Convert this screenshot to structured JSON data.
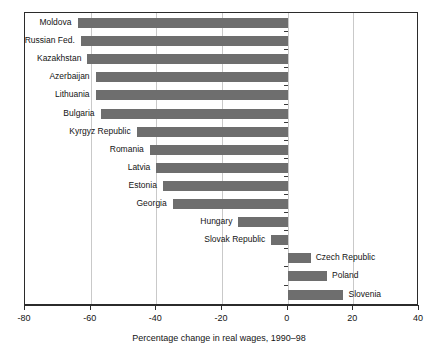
{
  "chart_data": {
    "type": "bar",
    "orientation": "horizontal",
    "title": "",
    "subtitle": "",
    "xlabel": "Percentage change in real wages, 1990–98",
    "ylabel": "",
    "xlim": [
      -80,
      40
    ],
    "ylim": null,
    "grid": "vertical gridlines at each major x tick",
    "legend": "none",
    "bar_color": "#6e6e6e",
    "frame_color": "#2b2b2b",
    "gridline_color": "#c9c9c9",
    "xticks": [
      -80,
      -60,
      -40,
      -20,
      0,
      20,
      40
    ],
    "xticklabels": [
      "-80",
      "-60",
      "-40",
      "-20",
      "0",
      "20",
      "40"
    ],
    "categories": [
      "Moldova",
      "Russian Fed.",
      "Kazakhstan",
      "Azerbaijan",
      "Lithuania",
      "Bulgaria",
      "Kyrgyz Republic",
      "Romania",
      "Latvia",
      "Estonia",
      "Georgia",
      "Hungary",
      "Slovak Republic",
      "Czech Republic",
      "Poland",
      "Slovenia"
    ],
    "values": [
      -64,
      -63,
      -61,
      -58.5,
      -58.5,
      -57,
      -46,
      -42,
      -40,
      -38,
      -35,
      -15,
      -5,
      7,
      12,
      17
    ]
  },
  "axis": {
    "ticks": [
      {
        "label": "-80",
        "value": -80
      },
      {
        "label": "-60",
        "value": -60
      },
      {
        "label": "-40",
        "value": -40
      },
      {
        "label": "-20",
        "value": -20
      },
      {
        "label": "0",
        "value": 0
      },
      {
        "label": "20",
        "value": 20
      },
      {
        "label": "40",
        "value": 40
      }
    ],
    "title": "Percentage change in real wages, 1990–98"
  },
  "bars": [
    {
      "label": "Moldova",
      "value": -64
    },
    {
      "label": "Russian Fed.",
      "value": -63
    },
    {
      "label": "Kazakhstan",
      "value": -61
    },
    {
      "label": "Azerbaijan",
      "value": -58.5
    },
    {
      "label": "Lithuania",
      "value": -58.5
    },
    {
      "label": "Bulgaria",
      "value": -57
    },
    {
      "label": "Kyrgyz Republic",
      "value": -46
    },
    {
      "label": "Romania",
      "value": -42
    },
    {
      "label": "Latvia",
      "value": -40
    },
    {
      "label": "Estonia",
      "value": -38
    },
    {
      "label": "Georgia",
      "value": -35
    },
    {
      "label": "Hungary",
      "value": -15
    },
    {
      "label": "Slovak Republic",
      "value": -5
    },
    {
      "label": "Czech Republic",
      "value": 7
    },
    {
      "label": "Poland",
      "value": 12
    },
    {
      "label": "Slovenia",
      "value": 17
    }
  ]
}
